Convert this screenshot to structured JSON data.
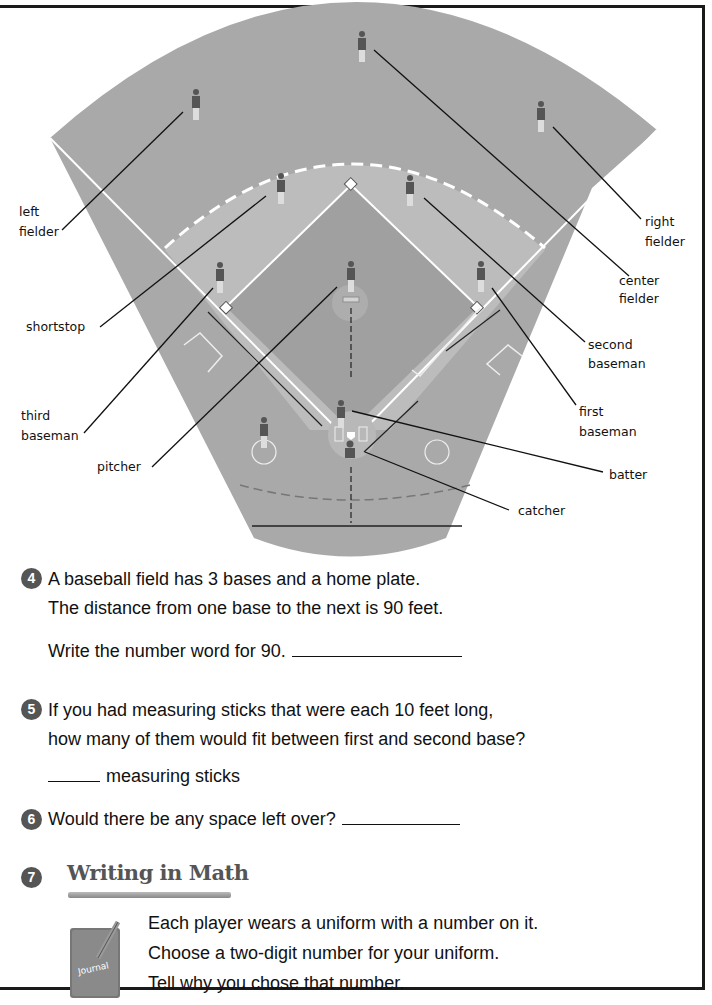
{
  "diagram": {
    "labels": {
      "left_fielder": [
        "left",
        "fielder"
      ],
      "right_fielder": [
        "right",
        "fielder"
      ],
      "center_fielder": [
        "center",
        "fielder"
      ],
      "shortstop": [
        "shortstop"
      ],
      "second_baseman": [
        "second",
        "baseman"
      ],
      "third_baseman": [
        "third",
        "baseman"
      ],
      "first_baseman": [
        "first",
        "baseman"
      ],
      "pitcher": [
        "pitcher"
      ],
      "batter": [
        "batter"
      ],
      "catcher": [
        "catcher"
      ]
    },
    "colors": {
      "outfield": "#a9a9a9",
      "infield": "#bdbdbd",
      "infield_dirt": "#a3a3a3",
      "lines": "#ffffff",
      "leader": "#111111"
    }
  },
  "questions": [
    {
      "number": "4",
      "lines": [
        "A baseball field has 3 bases and a home plate.",
        "The distance from one base to the next is 90 feet."
      ],
      "prompt": "Write the number word for 90."
    },
    {
      "number": "5",
      "lines": [
        "If you had measuring sticks that were each 10 feet long,",
        "how many of them would fit between first and second base?"
      ],
      "prompt": "measuring sticks"
    },
    {
      "number": "6",
      "lines": [
        "Would there be any space left over?"
      ]
    },
    {
      "number": "7",
      "heading": "Writing in Math",
      "journal_label": "Journal",
      "lines": [
        "Each player wears a uniform with a number on it.",
        "Choose a two-digit number for your uniform.",
        "Tell why you chose that number."
      ]
    }
  ]
}
